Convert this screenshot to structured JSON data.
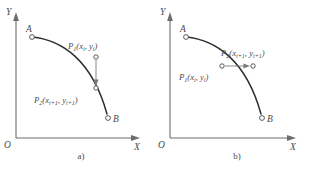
{
  "figure": {
    "panels": [
      {
        "id": "a",
        "caption": "a)",
        "axes": {
          "x_label": "X",
          "y_label": "Y",
          "origin_label": "O"
        },
        "points": [
          {
            "name": "A",
            "label": "A"
          },
          {
            "name": "B",
            "label": "B"
          },
          {
            "name": "P1",
            "label_main": "P",
            "label_sub": "1",
            "label_args": "(x",
            "label_args_sub": "i",
            "label_args_mid": ", y",
            "label_args_sub2": "i",
            "label_args_end": ")",
            "full": "P1(xi, yi)"
          },
          {
            "name": "P2",
            "label_main": "P",
            "label_sub": "2",
            "label_args": "(x",
            "label_args_sub": "i+1",
            "label_args_mid": ", y",
            "label_args_sub2": "i+1",
            "label_args_end": ")",
            "full": "P2(xi+1, yi+1)"
          }
        ],
        "arrow_direction": "down"
      },
      {
        "id": "b",
        "caption": "b)",
        "axes": {
          "x_label": "X",
          "y_label": "Y",
          "origin_label": "O"
        },
        "points": [
          {
            "name": "A",
            "label": "A"
          },
          {
            "name": "B",
            "label": "B"
          },
          {
            "name": "P1",
            "label_main": "P",
            "label_sub": "1",
            "label_args": "(x",
            "label_args_sub": "i",
            "label_args_mid": ", y",
            "label_args_sub2": "i",
            "label_args_end": ")",
            "full": "P1(xi, yi)"
          },
          {
            "name": "P2",
            "label_main": "P",
            "label_sub": "2",
            "label_args": "(x",
            "label_args_sub": "i+1",
            "label_args_mid": ", y",
            "label_args_sub2": "i+1",
            "label_args_end": ")",
            "full": "P2(xi+1, yi+1)"
          }
        ],
        "arrow_direction": "right"
      }
    ]
  },
  "colors": {
    "curve": "#2f2f2f",
    "axis": "#6d6d6d",
    "arrow": "#7a7a7a",
    "text": "#4a4a4a",
    "background": "#ffffff"
  }
}
